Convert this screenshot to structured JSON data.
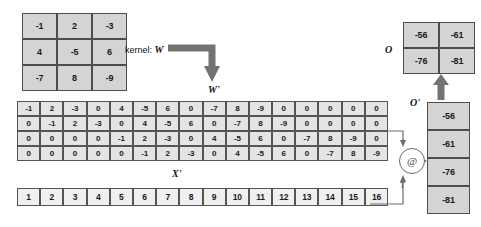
{
  "diagram": {
    "kernel_label_prefix": "kernel: ",
    "kernel_symbol": "W",
    "wprime_label": "W'",
    "xprime_label": "X'",
    "oprime_label": "O'",
    "o_label": "O",
    "transpose_marker": "T",
    "operator_symbol": "@",
    "colors": {
      "cell_fill_dark": "#d4d4d4",
      "cell_fill_light": "#e4e4e4",
      "cell_fill_white": "#f0f0f0",
      "border": "#4d4d4d",
      "arrow": "#737373",
      "text": "#1a1a1a"
    }
  },
  "kernel": {
    "name": "W",
    "rows": 3,
    "cols": 3,
    "values": [
      [
        "-1",
        "2",
        "-3"
      ],
      [
        "4",
        "-5",
        "6"
      ],
      [
        "-7",
        "8",
        "-9"
      ]
    ]
  },
  "wprime": {
    "name": "W'",
    "rows": 4,
    "cols": 16,
    "values": [
      [
        "-1",
        "2",
        "-3",
        "0",
        "4",
        "-5",
        "6",
        "0",
        "-7",
        "8",
        "-9",
        "0",
        "0",
        "0",
        "0",
        "0"
      ],
      [
        "0",
        "-1",
        "2",
        "-3",
        "0",
        "4",
        "-5",
        "6",
        "0",
        "-7",
        "8",
        "-9",
        "0",
        "0",
        "0",
        "0"
      ],
      [
        "0",
        "0",
        "0",
        "0",
        "-1",
        "2",
        "-3",
        "0",
        "4",
        "-5",
        "6",
        "0",
        "-7",
        "8",
        "-9",
        "0"
      ],
      [
        "0",
        "0",
        "0",
        "0",
        "0",
        "-1",
        "2",
        "-3",
        "0",
        "4",
        "-5",
        "6",
        "0",
        "-7",
        "8",
        "-9"
      ]
    ]
  },
  "xprime": {
    "name": "X'",
    "rows": 1,
    "cols": 16,
    "values": [
      "1",
      "2",
      "3",
      "4",
      "5",
      "6",
      "7",
      "8",
      "9",
      "10",
      "11",
      "12",
      "13",
      "14",
      "15",
      "16"
    ]
  },
  "oprime": {
    "name": "O'",
    "rows": 4,
    "cols": 1,
    "values": [
      "-56",
      "-61",
      "-76",
      "-81"
    ]
  },
  "o": {
    "name": "O",
    "rows": 2,
    "cols": 2,
    "values": [
      [
        "-56",
        "-61"
      ],
      [
        "-76",
        "-81"
      ]
    ]
  }
}
